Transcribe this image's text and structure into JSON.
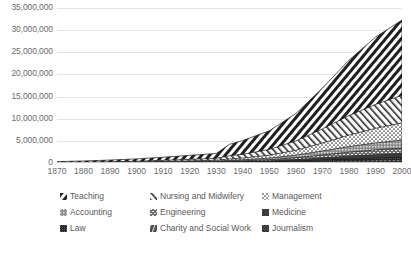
{
  "chart_data": {
    "type": "area",
    "title": "",
    "xlabel": "",
    "ylabel": "",
    "stacked": true,
    "grid": true,
    "legend_position": "bottom",
    "xlim": [
      1870,
      2000
    ],
    "ylim": [
      0,
      35000000
    ],
    "y_ticks": [
      0,
      5000000,
      10000000,
      15000000,
      20000000,
      25000000,
      30000000,
      35000000
    ],
    "y_tick_labels": [
      "0",
      "5,000,000",
      "10,000,000",
      "15,000,000",
      "20,000,000",
      "25,000,000",
      "30,000,000",
      "35,000,000"
    ],
    "x_ticks": [
      1870,
      1880,
      1890,
      1900,
      1910,
      1920,
      1930,
      1940,
      1950,
      1960,
      1970,
      1980,
      1990,
      2000
    ],
    "x_tick_labels": [
      "1870",
      "1880",
      "1890",
      "1900",
      "1910",
      "1920",
      "1930",
      "1940",
      "1950",
      "1960",
      "1970",
      "1980",
      "1990",
      "2000"
    ],
    "x": [
      1870,
      1880,
      1890,
      1900,
      1910,
      1920,
      1930,
      1935,
      1940,
      1950,
      1960,
      1970,
      1980,
      1990,
      2000
    ],
    "series": [
      {
        "name": "Teaching",
        "pattern": "dense-diagonal-hatch",
        "values": [
          180000,
          260000,
          380000,
          520000,
          700000,
          900000,
          1100000,
          2600000,
          3100000,
          4200000,
          6200000,
          9200000,
          12500000,
          15200000,
          17000000
        ]
      },
      {
        "name": "Nursing and Midwifery",
        "pattern": "fine-diagonal-hatch",
        "values": [
          60000,
          90000,
          130000,
          180000,
          260000,
          340000,
          420000,
          700000,
          850000,
          1300000,
          2100000,
          3200000,
          4400000,
          5400000,
          6200000
        ]
      },
      {
        "name": "Management",
        "pattern": "sparse-dots",
        "values": [
          20000,
          30000,
          45000,
          70000,
          110000,
          160000,
          210000,
          320000,
          400000,
          650000,
          1100000,
          1800000,
          2600000,
          3300000,
          3900000
        ]
      },
      {
        "name": "Accounting",
        "pattern": "light-stipple",
        "values": [
          15000,
          22000,
          32000,
          48000,
          72000,
          100000,
          130000,
          190000,
          230000,
          360000,
          580000,
          900000,
          1250000,
          1550000,
          1800000
        ]
      },
      {
        "name": "Engineering",
        "pattern": "cross-dash",
        "values": [
          12000,
          18000,
          26000,
          38000,
          56000,
          78000,
          100000,
          145000,
          175000,
          270000,
          430000,
          660000,
          900000,
          1100000,
          1250000
        ]
      },
      {
        "name": "Medicine",
        "pattern": "solid-dark",
        "values": [
          10000,
          14000,
          20000,
          29000,
          42000,
          58000,
          74000,
          105000,
          126000,
          190000,
          300000,
          450000,
          610000,
          740000,
          840000
        ]
      },
      {
        "name": "Law",
        "pattern": "micro-dot",
        "values": [
          8000,
          11000,
          15000,
          21000,
          30000,
          41000,
          52000,
          72000,
          86000,
          128000,
          200000,
          300000,
          400000,
          480000,
          540000
        ]
      },
      {
        "name": "Charity and Social Work",
        "pattern": "wavy-hatch",
        "values": [
          5000,
          7000,
          10000,
          14000,
          20000,
          27000,
          35000,
          50000,
          60000,
          90000,
          145000,
          220000,
          300000,
          365000,
          415000
        ]
      },
      {
        "name": "Journalism",
        "pattern": "checker-dark",
        "values": [
          4000,
          5500,
          8000,
          11000,
          16000,
          22000,
          28000,
          40000,
          48000,
          72000,
          115000,
          175000,
          235000,
          285000,
          325000
        ]
      }
    ],
    "total_peak_value": 31270000,
    "total_peak_year": 2000
  },
  "legend": {
    "rows": [
      [
        {
          "label": "Teaching",
          "swatch": "dense-hatch-swatch"
        },
        {
          "label": "Nursing and Midwifery",
          "swatch": "fine-hatch-swatch"
        },
        {
          "label": "Management",
          "swatch": "sparse-dot-swatch"
        }
      ],
      [
        {
          "label": "Accounting",
          "swatch": "light-stipple-swatch"
        },
        {
          "label": "Engineering",
          "swatch": "cross-dash-swatch"
        },
        {
          "label": "Medicine",
          "swatch": "solid-dark-swatch"
        }
      ],
      [
        {
          "label": "Law",
          "swatch": "micro-dot-swatch"
        },
        {
          "label": "Charity and Social Work",
          "swatch": "wavy-hatch-swatch"
        },
        {
          "label": "Journalism",
          "swatch": "checker-dark-swatch"
        }
      ]
    ]
  },
  "colors": {
    "gridline": "#e4e4e4",
    "axis": "#c9c9c9",
    "text": "#6b6b6b",
    "legend_text": "#595959",
    "dark_fill": "#2b2b2b",
    "mid_fill": "#5a5a5a",
    "light_fill": "#ffffff",
    "background": "#ffffff"
  }
}
